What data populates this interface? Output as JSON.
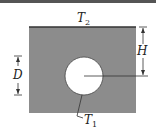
{
  "diagram": {
    "type": "cross-section",
    "labels": {
      "top_surface_temp": {
        "symbol": "T",
        "subscript": "2"
      },
      "cylinder_temp": {
        "symbol": "T",
        "subscript": "1"
      },
      "height": "H",
      "depth": "D"
    },
    "colors": {
      "medium": "#8c8c8c",
      "cylinder": "#ffffff",
      "lines": "#333333",
      "top_border": "#555555"
    }
  }
}
